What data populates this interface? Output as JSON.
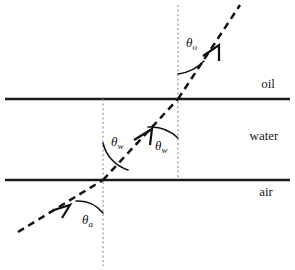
{
  "figure": {
    "background_color": "#ffffff",
    "line_color": "#1a1a1a",
    "ray_color": "#111111",
    "normal_color": "#9a9a9a"
  },
  "media": [
    {
      "id": "oil",
      "label": "oil",
      "label_x": 268,
      "label_y": 88
    },
    {
      "id": "water",
      "label": "water",
      "label_x": 264,
      "label_y": 140
    },
    {
      "id": "air",
      "label": "air",
      "label_x": 266,
      "label_y": 196
    }
  ],
  "interfaces": [
    {
      "id": "water-oil-interface",
      "y": 99,
      "x1": 5,
      "x2": 290
    },
    {
      "id": "air-water-interface",
      "y": 180,
      "x1": 5,
      "x2": 290
    }
  ],
  "normals": [
    {
      "id": "normal-at-air-water",
      "x": 103,
      "y1": 99,
      "y2": 266
    },
    {
      "id": "normal-at-water-oil",
      "x": 178,
      "y1": 5,
      "y2": 180
    }
  ],
  "ray": {
    "id": "light-ray",
    "points": [
      {
        "x": 18,
        "y": 232
      },
      {
        "x": 103,
        "y": 180
      },
      {
        "x": 178,
        "y": 99
      },
      {
        "x": 240,
        "y": 5
      }
    ],
    "arrows": [
      {
        "id": "arrow-incident-air",
        "x": 62,
        "y": 208,
        "angle": -31.5
      },
      {
        "id": "arrow-in-water",
        "x": 146,
        "y": 134,
        "angle": -47.2
      },
      {
        "id": "arrow-in-oil",
        "x": 212,
        "y": 49,
        "angle": -56.6
      }
    ]
  },
  "angles": [
    {
      "id": "theta-a",
      "symbol": "θ",
      "subscript": "a",
      "label_x": 82,
      "label_y": 224,
      "description": "angle of incidence in air measured from normal"
    },
    {
      "id": "theta-w-left",
      "symbol": "θ",
      "subscript": "w",
      "label_x": 111,
      "label_y": 146,
      "description": "refraction angle in water at air-water interface"
    },
    {
      "id": "theta-w-right",
      "symbol": "θ",
      "subscript": "w",
      "label_x": 155,
      "label_y": 150,
      "description": "incidence angle in water at water-oil interface"
    },
    {
      "id": "theta-o",
      "symbol": "θ",
      "subscript": "o",
      "label_x": 186,
      "label_y": 47,
      "description": "refraction angle in oil"
    }
  ]
}
